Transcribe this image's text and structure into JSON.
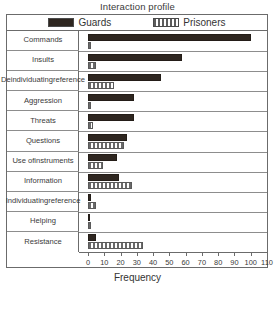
{
  "chart_data": {
    "type": "bar",
    "orientation": "horizontal",
    "title": "Interaction profile",
    "xlabel": "Frequency",
    "ylabel": "",
    "xlim": [
      0,
      110
    ],
    "xticks": [
      0,
      10,
      20,
      30,
      40,
      50,
      60,
      70,
      80,
      90,
      100,
      110
    ],
    "grid": false,
    "legend_position": "top",
    "categories": [
      "Commands",
      "Insults",
      "Deindividuating reference",
      "Aggression",
      "Threats",
      "Questions",
      "Use of instruments",
      "Information",
      "Individuating reference",
      "Helping",
      "Resistance"
    ],
    "category_labels_display": [
      "Commands",
      "Insults",
      "Deindividuating\nreference",
      "Aggression",
      "Threats",
      "Questions",
      "Use of\ninstruments",
      "Information",
      "Individuating\nreference",
      "Helping",
      "Resistance"
    ],
    "series": [
      {
        "name": "Guards",
        "color": "#2e2620",
        "fill": "solid",
        "values": [
          100,
          58,
          45,
          28,
          28,
          24,
          18,
          19,
          1,
          0,
          5
        ]
      },
      {
        "name": "Prisoners",
        "color": "#6a6a6a",
        "fill": "vertical-hatch",
        "values": [
          1,
          5,
          16,
          2,
          3,
          22,
          9,
          27,
          5,
          1,
          34
        ]
      }
    ]
  },
  "legend": {
    "items": [
      {
        "label": "Guards",
        "swatch": "solid-dark-swatch"
      },
      {
        "label": "Prisoners",
        "swatch": "hatched-swatch"
      }
    ]
  },
  "axis": {
    "title": "Frequency",
    "tick_labels": [
      "0",
      "10",
      "20",
      "30",
      "40",
      "50",
      "60",
      "70",
      "80",
      "90",
      "100",
      "110"
    ]
  }
}
